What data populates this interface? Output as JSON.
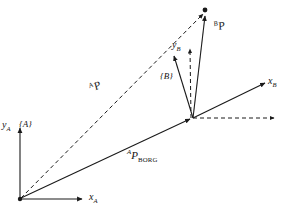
{
  "figure": {
    "background_color": "#ffffff",
    "stroke_color": "#1a1a1a",
    "labels": {
      "y_axis_a": "y",
      "y_axis_a_sub": "A",
      "x_axis_a": "x",
      "x_axis_a_sub": "A",
      "frame_a": "{A}",
      "y_axis_b": "y",
      "y_axis_b_sub": "B",
      "x_axis_b": "x",
      "x_axis_b_sub": "B",
      "frame_b": "{B}",
      "vector_ap_sup": "A",
      "vector_ap": "P",
      "vector_bp_sup": "B",
      "vector_bp": "P",
      "vector_apborg_sup": "A",
      "vector_apborg": "P",
      "vector_apborg_sub": "BORG"
    },
    "geometry": {
      "origin_a": [
        20,
        199
      ],
      "origin_b": [
        193,
        118
      ],
      "point_p": [
        206,
        11
      ],
      "y_axis_a_tip": [
        20,
        124
      ],
      "x_axis_a_tip": [
        85,
        199
      ],
      "y_axis_b_tip": [
        172,
        52
      ],
      "x_axis_b_tip": [
        268,
        82
      ],
      "dashed_horizontal_tip": [
        277,
        118
      ],
      "dashed_vertical_tip": [
        190,
        45
      ]
    }
  }
}
